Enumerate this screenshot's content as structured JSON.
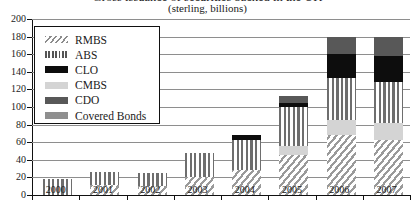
{
  "chart_data": {
    "type": "bar",
    "stacked": true,
    "title": "Gross issuance of securities backed in the UK",
    "subtitle": "(sterling, billions)",
    "xlabel": "",
    "ylabel": "",
    "ylim": [
      0,
      200
    ],
    "ytick_step": 20,
    "grid": true,
    "legend_position": "upper-left",
    "categories": [
      "2000",
      "2001",
      "2002",
      "2003",
      "2004",
      "2005",
      "2006",
      "2007"
    ],
    "yticks": [
      "0",
      "20",
      "40",
      "60",
      "80",
      "100",
      "120",
      "140",
      "160",
      "180",
      "200"
    ],
    "series": [
      {
        "name": "RMBS",
        "color": "#9a9a9a",
        "pattern": "diagonal-hatch",
        "values": [
          0,
          11,
          10,
          20,
          28,
          46,
          68,
          62
        ]
      },
      {
        "name": "CMBS",
        "color": "#d4d4d4",
        "pattern": "solid-light",
        "values": [
          0,
          0,
          0,
          0,
          0,
          10,
          17,
          20
        ]
      },
      {
        "name": "ABS",
        "color": "#6e6e6e",
        "pattern": "vertical-stripe",
        "values": [
          18,
          15,
          15,
          28,
          34,
          44,
          48,
          46
        ]
      },
      {
        "name": "CLO",
        "color": "#0d0d0d",
        "pattern": "solid-black",
        "values": [
          0,
          0,
          0,
          0,
          6,
          5,
          27,
          30
        ]
      },
      {
        "name": "CDO",
        "color": "#585858",
        "pattern": "solid-dark",
        "values": [
          0,
          0,
          0,
          0,
          0,
          8,
          20,
          22
        ]
      },
      {
        "name": "Covered Bonds",
        "color": "#8f8f8f",
        "pattern": "solid-mid",
        "values": [
          0,
          0,
          0,
          0,
          0,
          0,
          0,
          0
        ]
      }
    ],
    "totals": [
      18,
      26,
      25,
      48,
      68,
      113,
      180,
      180
    ]
  },
  "legend": {
    "items": [
      {
        "label": "RMBS",
        "swatch": "rmbs-swatch-icon"
      },
      {
        "label": "ABS",
        "swatch": "abs-swatch-icon"
      },
      {
        "label": "CLO",
        "swatch": "clo-swatch-icon"
      },
      {
        "label": "CMBS",
        "swatch": "cmbs-swatch-icon"
      },
      {
        "label": "CDO",
        "swatch": "cdo-swatch-icon"
      },
      {
        "label": "Covered Bonds",
        "swatch": "covered-bonds-swatch-icon"
      }
    ]
  }
}
